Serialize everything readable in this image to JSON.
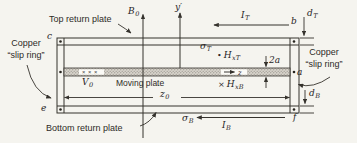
{
  "colors": {
    "paper": "#f5f4ef",
    "ink": "#35322d",
    "band_fill": "#d7d3cb",
    "band_dot": "#7c7870",
    "inset_box": "#fbfaf6"
  },
  "annotations": {
    "top_plate": "Top return plate",
    "bottom_plate": "Bottom return plate",
    "moving_plate": "Moving plate",
    "copper_left": {
      "line1": "Copper",
      "line2": "“slip ring”"
    },
    "copper_right": {
      "line1": "Copper",
      "line2": "“slip ring”"
    },
    "crosses_in_plate": "× × ×",
    "field_dot": "•",
    "field_cross": "×"
  },
  "math": {
    "b0": {
      "main": "B",
      "sub": "0"
    },
    "y_axis": {
      "main": "y′",
      "sub": ""
    },
    "z_axis": {
      "main": "z",
      "sub": ""
    },
    "i_top": {
      "main": "I",
      "sub": "T"
    },
    "i_bottom": {
      "main": "I",
      "sub": "B"
    },
    "d_top": {
      "main": "d",
      "sub": "T"
    },
    "d_bottom": {
      "main": "d",
      "sub": "B"
    },
    "sigma_top": {
      "main": "σ",
      "sub": "T"
    },
    "sigma_bottom": {
      "main": "σ",
      "sub": "B"
    },
    "h_x_top": {
      "main": "H",
      "sub": "xT"
    },
    "h_x_bottom": {
      "main": "H",
      "sub": "xB"
    },
    "v0": {
      "main": "V",
      "sub": "0"
    },
    "z0": {
      "main": "z",
      "sub": "0"
    },
    "gap_width": {
      "main": "2a",
      "sub": ""
    },
    "half_gap": {
      "main": "a",
      "sub": ""
    },
    "terminal_b": "b",
    "terminal_c": "c",
    "terminal_e": "e",
    "terminal_f": "f"
  }
}
